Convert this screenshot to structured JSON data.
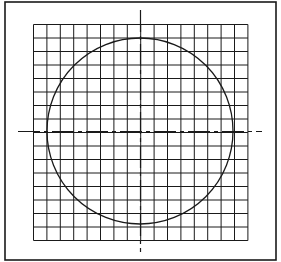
{
  "diagram": {
    "type": "circle-on-grid",
    "frame": {
      "x": 5,
      "y": 2,
      "width": 271,
      "height": 258,
      "stroke": "#1a1a1a"
    },
    "grid": {
      "x0": 33.5,
      "y0": 24.5,
      "cols": 16,
      "rows": 16,
      "cell_w": 13.4,
      "cell_h": 13.5,
      "stroke": "#1a1a1a"
    },
    "axes": {
      "center_x": 140.5,
      "center_y": 131.5,
      "horizontal": {
        "x1": 18,
        "x2": 262
      },
      "vertical": {
        "y1": 10,
        "y2": 252
      },
      "style": "dash-dot",
      "stroke": "#1a1a1a"
    },
    "circle": {
      "cx": 140,
      "cy": 131,
      "r": 93,
      "stroke": "#1a1a1a"
    },
    "colors": {
      "background": "#ffffff",
      "ink": "#1a1a1a"
    }
  }
}
